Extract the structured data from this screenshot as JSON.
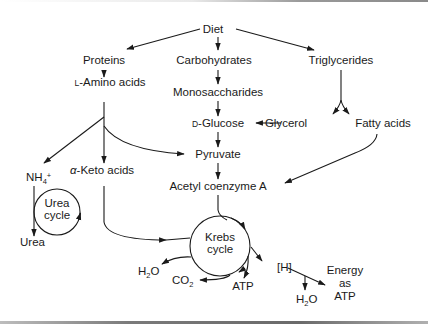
{
  "diagram": {
    "type": "metabolic-pathway",
    "nodes": {
      "diet": "Diet",
      "proteins": "Proteins",
      "carbohydrates": "Carbohydrates",
      "triglycerides": "Triglycerides",
      "amino_prefix": "L",
      "amino_rest": "-Amino acids",
      "monosaccharides": "Monosaccharides",
      "glucose_prefix": "D",
      "glucose_rest": "-Glucose",
      "glycerol": "Glycerol",
      "fatty_acids": "Fatty acids",
      "pyruvate": "Pyruvate",
      "ammonium_main": "NH",
      "ammonium_sub": "4",
      "ammonium_sup": "+",
      "keto_prefix": "α",
      "keto_rest": "-Keto acids",
      "acetyl_coa": "Acetyl coenzyme A",
      "urea_cycle_line1": "Urea",
      "urea_cycle_line2": "cycle",
      "urea": "Urea",
      "krebs_line1": "Krebs",
      "krebs_line2": "cycle",
      "h2o_left_h": "H",
      "h2o_left_sub": "2",
      "h2o_left_o": "O",
      "co2_c": "CO",
      "co2_sub": "2",
      "atp": "ATP",
      "hydrogen": "[H]",
      "h2o_right_h": "H",
      "h2o_right_sub": "2",
      "h2o_right_o": "O",
      "energy_line1": "Energy",
      "energy_line2": "as",
      "energy_line3": "ATP"
    },
    "edges": [
      [
        "Diet",
        "Proteins"
      ],
      [
        "Diet",
        "Carbohydrates"
      ],
      [
        "Diet",
        "Triglycerides"
      ],
      [
        "Proteins",
        "L-Amino acids"
      ],
      [
        "Carbohydrates",
        "Monosaccharides"
      ],
      [
        "Monosaccharides",
        "D-Glucose"
      ],
      [
        "Triglycerides",
        "Glycerol"
      ],
      [
        "Triglycerides",
        "Fatty acids"
      ],
      [
        "Glycerol",
        "D-Glucose"
      ],
      [
        "D-Glucose",
        "Pyruvate"
      ],
      [
        "L-Amino acids",
        "NH4+"
      ],
      [
        "L-Amino acids",
        "α-Keto acids"
      ],
      [
        "L-Amino acids",
        "Pyruvate"
      ],
      [
        "Pyruvate",
        "Acetyl coenzyme A"
      ],
      [
        "Fatty acids",
        "Acetyl coenzyme A"
      ],
      [
        "NH4+",
        "Urea"
      ],
      [
        "α-Keto acids",
        "Krebs cycle"
      ],
      [
        "Acetyl coenzyme A",
        "Krebs cycle"
      ],
      [
        "Krebs cycle",
        "H2O"
      ],
      [
        "Krebs cycle",
        "CO2"
      ],
      [
        "Krebs cycle",
        "ATP"
      ],
      [
        "Krebs cycle",
        "[H]"
      ],
      [
        "[H]",
        "H2O"
      ],
      [
        "[H]",
        "Energy as ATP"
      ]
    ]
  }
}
